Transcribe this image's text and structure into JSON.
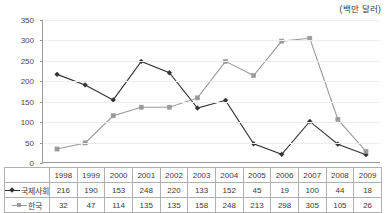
{
  "unit_caption": "(백만 달러)",
  "chart_data": {
    "type": "line",
    "title": "",
    "subtitle": "",
    "xlabel": "",
    "ylabel": "",
    "unit_note": "(백만 달러)",
    "categories": [
      "1998",
      "1999",
      "2000",
      "2001",
      "2002",
      "2003",
      "2004",
      "2005",
      "2006",
      "2007",
      "2008",
      "2009"
    ],
    "series": [
      {
        "name": "국제사회",
        "color": "#333333",
        "marker": "diamond",
        "values": [
          216,
          190,
          153,
          248,
          220,
          133,
          152,
          45,
          19,
          100,
          44,
          18
        ]
      },
      {
        "name": "한국",
        "color": "#9a9a9a",
        "marker": "square",
        "values": [
          32,
          47,
          114,
          135,
          135,
          158,
          248,
          213,
          298,
          305,
          105,
          26
        ]
      }
    ],
    "ylim": [
      0,
      350
    ],
    "ytick_step": 50,
    "yticks": [
      "350",
      "300",
      "250",
      "200",
      "150",
      "100",
      "50",
      "0"
    ],
    "grid": true,
    "legend_position": "table-row-labels"
  },
  "table": {
    "header_corner": "",
    "columns": [
      "1998",
      "1999",
      "2000",
      "2001",
      "2002",
      "2003",
      "2004",
      "2005",
      "2006",
      "2007",
      "2008",
      "2009"
    ],
    "rows": [
      {
        "label": "국제사회",
        "values": [
          "216",
          "190",
          "153",
          "248",
          "220",
          "133",
          "152",
          "45",
          "19",
          "100",
          "44",
          "18"
        ]
      },
      {
        "label": "한국",
        "values": [
          "32",
          "47",
          "114",
          "135",
          "135",
          "158",
          "248",
          "213",
          "298",
          "305",
          "105",
          "26"
        ]
      }
    ]
  }
}
